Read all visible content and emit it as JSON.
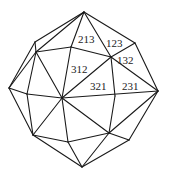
{
  "diagram": {
    "title": "",
    "type": "polyhedron-wireframe",
    "stroke_color": "#1a1a1a",
    "background": "#ffffff",
    "vertices": {
      "top": [
        84,
        12
      ],
      "ul_out": [
        35,
        42
      ],
      "ul_in": [
        36,
        52
      ],
      "tm": [
        71,
        47
      ],
      "ur_in": [
        111,
        57
      ],
      "ur_out": [
        135,
        43
      ],
      "right": [
        158,
        91
      ],
      "left": [
        9,
        88
      ],
      "center": [
        62,
        98
      ],
      "l_in": [
        27,
        94
      ],
      "mr": [
        115,
        96
      ],
      "ll": [
        33,
        135
      ],
      "lm": [
        68,
        142
      ],
      "lr_in": [
        109,
        133
      ],
      "lr_out": [
        129,
        140
      ],
      "bottom": [
        82,
        167
      ]
    },
    "labels": [
      {
        "text": "213",
        "x": 78,
        "y": 43
      },
      {
        "text": "123",
        "x": 107,
        "y": 47
      },
      {
        "text": "132",
        "x": 117,
        "y": 63
      },
      {
        "text": "312",
        "x": 72,
        "y": 73
      },
      {
        "text": "321",
        "x": 91,
        "y": 90
      },
      {
        "text": "231",
        "x": 123,
        "y": 90
      }
    ]
  }
}
